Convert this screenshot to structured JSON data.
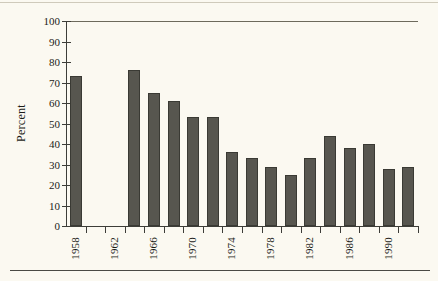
{
  "chart_data": {
    "type": "bar",
    "title": "",
    "subtitle": "",
    "xlabel": "",
    "ylabel": "Percent",
    "ylim": [
      0,
      100
    ],
    "yticks": [
      0,
      10,
      20,
      30,
      40,
      50,
      60,
      70,
      80,
      90,
      100
    ],
    "ytick_labels": [
      "0",
      "10",
      "20",
      "30",
      "40",
      "50",
      "60",
      "70",
      "80",
      "90",
      "100"
    ],
    "grid": false,
    "legend": null,
    "legend_position": "none",
    "bar_color": "#57564f",
    "background_color": "#fbf9f1",
    "axis_color": "#3d3d38",
    "categories": [
      "1958",
      "1960",
      "1962",
      "1964",
      "1966",
      "1968",
      "1970",
      "1972",
      "1974",
      "1976",
      "1978",
      "1980",
      "1982",
      "1984",
      "1986",
      "1988",
      "1990",
      "1992"
    ],
    "values": [
      73,
      null,
      null,
      76,
      65,
      61,
      53,
      53,
      36,
      33,
      29,
      25,
      33,
      44,
      38,
      40,
      28,
      29
    ],
    "xtick_labels_shown": [
      "1958",
      "1962",
      "1966",
      "1970",
      "1974",
      "1978",
      "1982",
      "1986",
      "1990"
    ]
  },
  "figure": {
    "y_axis_title": "Percent"
  }
}
